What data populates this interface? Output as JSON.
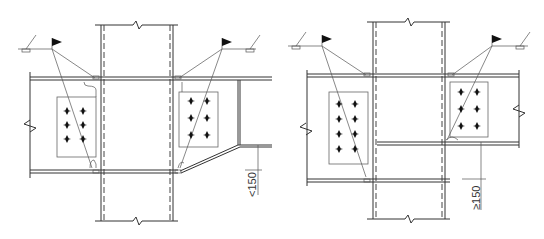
{
  "drawing": {
    "type": "steel beam-to-column connection details",
    "line_color": "#333333",
    "background": "#ffffff"
  },
  "details": [
    {
      "id": "left",
      "description": "Beam flanges of unequal depth with sloped haunch",
      "dimension_label": "<150",
      "bolt_groups": [
        {
          "side": "left",
          "rows": 3,
          "cols": 2
        },
        {
          "side": "right",
          "rows": 3,
          "cols": 2
        }
      ],
      "weld_symbols": [
        "flag-left",
        "flag-right",
        "fillet-left",
        "fillet-right"
      ]
    },
    {
      "id": "right",
      "description": "Beam flanges of unequal depth with stiffener",
      "dimension_label": "≥150",
      "bolt_groups": [
        {
          "side": "left",
          "rows": 4,
          "cols": 2
        },
        {
          "side": "right",
          "rows": 3,
          "cols": 2
        }
      ],
      "weld_symbols": [
        "flag-left",
        "flag-right",
        "fillet-left",
        "fillet-right"
      ]
    }
  ]
}
